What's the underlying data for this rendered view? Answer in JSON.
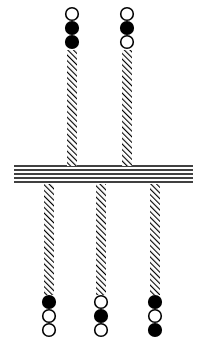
{
  "diagram": {
    "type": "membrane-bead-strands",
    "colors": {
      "ink": "#000000",
      "background": "#ffffff"
    },
    "membrane": {
      "x1": 14,
      "x2": 193,
      "y_top": 166,
      "lines": 5,
      "spacing": 4
    },
    "top_strands": [
      {
        "x": 72,
        "beads": [
          "open",
          "filled",
          "filled"
        ],
        "bead_y": [
          14,
          28,
          42
        ],
        "hatch_y1": 50,
        "hatch_y2": 166
      },
      {
        "x": 127,
        "beads": [
          "open",
          "filled",
          "open"
        ],
        "bead_y": [
          14,
          28,
          42
        ],
        "hatch_y1": 50,
        "hatch_y2": 166
      }
    ],
    "bottom_strands": [
      {
        "x": 49,
        "beads": [
          "filled",
          "open",
          "open"
        ],
        "bead_y": [
          302,
          316,
          330
        ],
        "hatch_y1": 184,
        "hatch_y2": 295
      },
      {
        "x": 101,
        "beads": [
          "open",
          "filled",
          "open"
        ],
        "bead_y": [
          302,
          316,
          330
        ],
        "hatch_y1": 184,
        "hatch_y2": 295
      },
      {
        "x": 155,
        "beads": [
          "filled",
          "open",
          "filled"
        ],
        "bead_y": [
          302,
          316,
          330
        ],
        "hatch_y1": 184,
        "hatch_y2": 295
      }
    ]
  }
}
